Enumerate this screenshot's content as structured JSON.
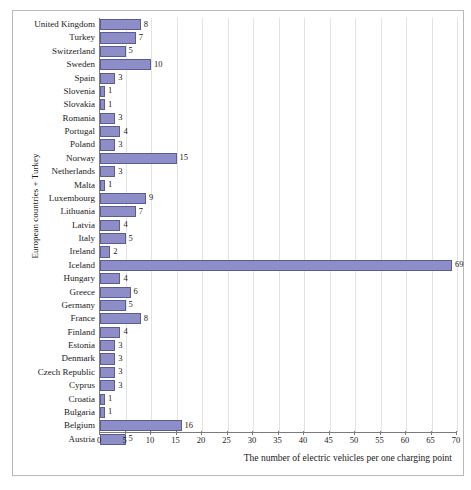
{
  "chart_data": {
    "type": "bar",
    "orientation": "horizontal",
    "title": "",
    "xlabel": "The number of electric vehicles per one charging point",
    "ylabel": "European countries + Turkey",
    "xlim": [
      0,
      70
    ],
    "xticks": [
      0,
      5,
      10,
      15,
      20,
      25,
      30,
      35,
      40,
      45,
      50,
      55,
      60,
      65,
      70
    ],
    "grid": "vertical",
    "legend": "none",
    "bar_color": "#8d8dc8",
    "bar_border_color": "#5b5b96",
    "categories": [
      "United Kingdom",
      "Turkey",
      "Switzerland",
      "Sweden",
      "Spain",
      "Slovenia",
      "Slovakia",
      "Romania",
      "Portugal",
      "Poland",
      "Norway",
      "Netherlands",
      "Malta",
      "Luxembourg",
      "Lithuania",
      "Latvia",
      "Italy",
      "Ireland",
      "Iceland",
      "Hungary",
      "Greece",
      "Germany",
      "France",
      "Finland",
      "Estonia",
      "Denmark",
      "Czech Republic",
      "Cyprus",
      "Croatia",
      "Bulgaria",
      "Belgium",
      "Austria"
    ],
    "values": [
      8,
      7,
      5,
      10,
      3,
      1,
      1,
      3,
      4,
      3,
      15,
      3,
      1,
      9,
      7,
      4,
      5,
      2,
      69,
      4,
      6,
      5,
      8,
      4,
      3,
      3,
      3,
      3,
      1,
      1,
      16,
      5
    ]
  }
}
